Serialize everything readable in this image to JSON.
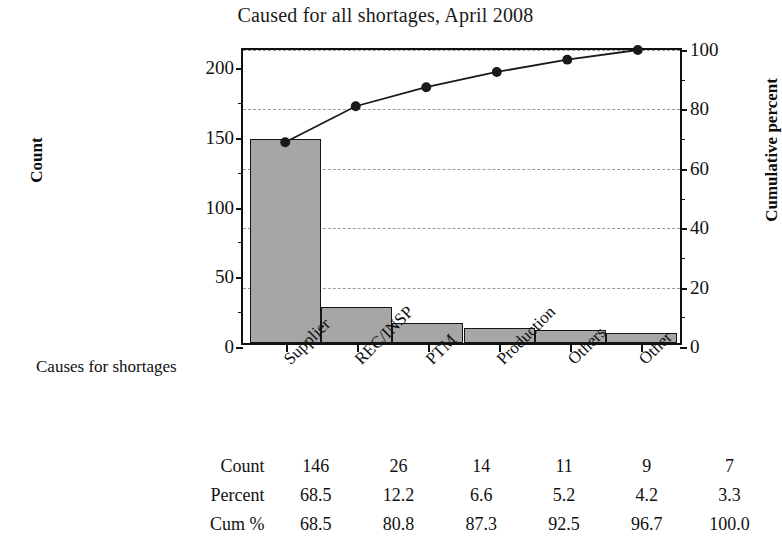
{
  "chart_data": {
    "type": "bar",
    "title": "Caused for all shortages, April 2008",
    "xlabel": "Causes for shortages",
    "ylabel": "Count",
    "y2label": "Cumulative percent",
    "categories": [
      "Supplier",
      "REC/INSP",
      "PTM",
      "Production",
      "Others",
      "Other"
    ],
    "values": [
      146,
      26,
      14,
      11,
      9,
      7
    ],
    "percent": [
      68.5,
      12.2,
      6.6,
      5.2,
      4.2,
      3.3
    ],
    "cum_percent": [
      68.5,
      80.8,
      87.3,
      92.5,
      96.7,
      100.0
    ],
    "ylim": [
      0,
      213
    ],
    "y2lim": [
      0,
      100
    ],
    "yticks": [
      0,
      50,
      100,
      150,
      200
    ],
    "y2ticks": [
      0,
      20,
      40,
      60,
      80,
      100
    ],
    "grid": true,
    "gridline_values": [
      20,
      40,
      60,
      80,
      100
    ],
    "legend": "none",
    "series": [
      {
        "name": "Count",
        "type": "bar",
        "values": [
          146,
          26,
          14,
          11,
          9,
          7
        ]
      },
      {
        "name": "Cum %",
        "type": "line",
        "values": [
          68.5,
          80.8,
          87.3,
          92.5,
          96.7,
          100.0
        ]
      }
    ],
    "colors": {
      "bar_fill": "#a6a6a6",
      "bar_edge": "#151515",
      "line": "#1a1a1a",
      "marker": "#1a1a1a",
      "gridline": "#9a9a9a",
      "axis": "#111111",
      "background": "#ffffff"
    }
  },
  "table": {
    "rows": [
      {
        "label": "Count",
        "values": [
          "146",
          "26",
          "14",
          "11",
          "9",
          "7"
        ]
      },
      {
        "label": "Percent",
        "values": [
          "68.5",
          "12.2",
          "6.6",
          "5.2",
          "4.2",
          "3.3"
        ]
      },
      {
        "label": "Cum %",
        "values": [
          "68.5",
          "80.8",
          "87.3",
          "92.5",
          "96.7",
          "100.0"
        ]
      }
    ]
  },
  "axes": {
    "left_ticks": [
      "0",
      "50",
      "100",
      "150",
      "200"
    ],
    "right_ticks": [
      "0",
      "20",
      "40",
      "60",
      "80",
      "100"
    ]
  }
}
